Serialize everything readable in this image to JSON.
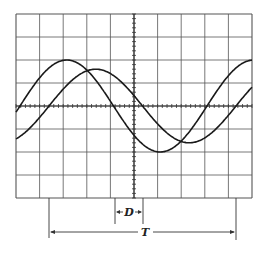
{
  "figure": {
    "type": "oscilloscope-trace",
    "grid": {
      "columns": 10,
      "rows": 8,
      "x0": 16,
      "y0": 14,
      "x1": 252,
      "y1": 198
    },
    "colors": {
      "grid": "#555555",
      "trace": "#1a1a1a",
      "background": "#ffffff"
    },
    "traces": [
      {
        "name": "trace-a",
        "amplitude_div": 2.0,
        "phase_note": "leading"
      },
      {
        "name": "trace-b",
        "amplitude_div": 1.6,
        "phase_note": "lagging"
      }
    ],
    "annotations": {
      "phase_shift_label": "D",
      "period_label": "T"
    }
  }
}
